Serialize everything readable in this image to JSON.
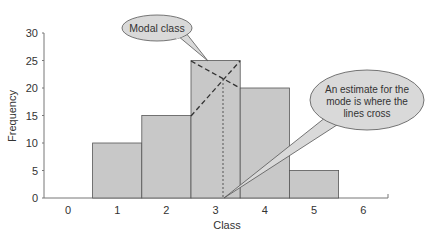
{
  "chart_data": {
    "type": "bar",
    "title": "",
    "xlabel": "Class",
    "ylabel": "Frequency",
    "categories": [
      "0",
      "1",
      "2",
      "3",
      "4",
      "5",
      "6"
    ],
    "values": [
      0,
      10,
      15,
      25,
      20,
      5,
      0
    ],
    "yticks": [
      "0",
      "5",
      "10",
      "15",
      "20",
      "25",
      "30"
    ],
    "ylim": [
      0,
      30
    ],
    "grid": false,
    "annotations": [
      {
        "text": "Modal class",
        "points_to": "top of bar at class 3"
      },
      {
        "text_lines": [
          "An estimate for the",
          "mode is where the",
          "lines cross"
        ],
        "points_to": "estimated mode on x-axis (~3.1)"
      }
    ],
    "estimated_mode": 3.1
  },
  "ui": {
    "bar_fill": "#c8c8c8",
    "bar_stroke": "#555555",
    "bubble_fill": "#d9d9d9"
  }
}
